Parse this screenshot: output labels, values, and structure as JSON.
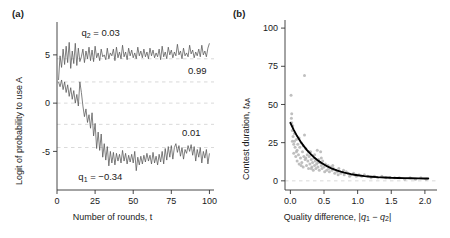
{
  "figure": {
    "width": 450,
    "height": 238,
    "background": "#ffffff"
  },
  "panel_a": {
    "label": "(a)",
    "chart_data": {
      "type": "line",
      "title": "",
      "xlabel": "Number of rounds, t",
      "ylabel": "Logit of probability to use A",
      "xlim": [
        0,
        103
      ],
      "ylim": [
        -9.0,
        8.2
      ],
      "xticks": [
        0,
        25,
        50,
        75,
        100
      ],
      "xticklabels": [
        "0",
        "25",
        "50",
        "75",
        "100"
      ],
      "yticks": [
        -5,
        0,
        5
      ],
      "yticklabels": [
        "-5",
        "0",
        "5"
      ],
      "grid": true,
      "gridlines_y": [
        4.595,
        2.197,
        0,
        -2.197,
        -4.595
      ],
      "grid_color": "#c8c8c8",
      "line_color": "#555555",
      "annotations": [
        {
          "text": "q2 = 0.03",
          "x": 16,
          "y": 7.0,
          "name": "q2-annotation"
        },
        {
          "text": "0.99",
          "x": 86,
          "y": 3.0,
          "name": "upper-prob-annotation"
        },
        {
          "text": "0.01",
          "x": 82,
          "y": -3.4,
          "name": "lower-prob-annotation"
        },
        {
          "text": "q1 = -0.34",
          "x": 14,
          "y": -8.0,
          "name": "q1-annotation"
        }
      ],
      "series": [
        {
          "name": "q2 = 0.03 (upper trace, converges to p = 0.99)",
          "plateau": 4.9,
          "x": [
            1,
            2,
            3,
            4,
            5,
            6,
            7,
            8,
            9,
            10,
            11,
            12,
            13,
            14,
            15,
            16,
            17,
            18,
            19,
            20,
            21,
            22,
            23,
            24,
            25,
            26,
            27,
            28,
            29,
            30,
            31,
            32,
            33,
            34,
            35,
            36,
            37,
            38,
            39,
            40,
            41,
            42,
            43,
            44,
            45,
            46,
            47,
            48,
            49,
            50,
            51,
            52,
            53,
            54,
            55,
            56,
            57,
            58,
            59,
            60,
            61,
            62,
            63,
            64,
            65,
            66,
            67,
            68,
            69,
            70,
            71,
            72,
            73,
            74,
            75,
            76,
            77,
            78,
            79,
            80,
            81,
            82,
            83,
            84,
            85,
            86,
            87,
            88,
            89,
            90,
            91,
            92,
            93,
            94,
            95,
            96,
            97,
            98,
            99,
            100
          ],
          "values": [
            2.4,
            4.9,
            3.7,
            5.6,
            4.0,
            5.9,
            4.2,
            6.3,
            3.6,
            5.4,
            4.1,
            6.2,
            3.9,
            5.7,
            4.3,
            4.8,
            5.6,
            4.2,
            5.4,
            4.6,
            5.8,
            4.4,
            5.5,
            4.3,
            5.9,
            4.7,
            5.2,
            4.4,
            5.6,
            4.8,
            5.0,
            4.5,
            5.7,
            4.6,
            5.2,
            4.9,
            5.6,
            4.4,
            5.8,
            4.7,
            5.3,
            4.6,
            6.0,
            4.8,
            5.3,
            4.5,
            5.7,
            4.9,
            5.5,
            4.7,
            5.2,
            4.6,
            5.8,
            4.9,
            5.4,
            4.7,
            5.6,
            4.8,
            5.3,
            4.6,
            5.7,
            4.9,
            5.5,
            4.7,
            5.2,
            4.8,
            5.6,
            4.5,
            5.9,
            4.8,
            5.3,
            4.6,
            5.8,
            5.0,
            5.5,
            4.7,
            5.3,
            4.9,
            6.1,
            5.0,
            5.4,
            4.6,
            5.7,
            4.9,
            5.2,
            4.8,
            6.0,
            5.1,
            5.5,
            4.7,
            5.3,
            4.9,
            5.6,
            4.8,
            6.0,
            5.0,
            5.4,
            4.8,
            5.7,
            6.2
          ]
        },
        {
          "name": "q1 = -0.34 (lower trace, converges to p = 0.01)",
          "plateau": -5.5,
          "x": [
            1,
            2,
            3,
            4,
            5,
            6,
            7,
            8,
            9,
            10,
            11,
            12,
            13,
            14,
            15,
            16,
            17,
            18,
            19,
            20,
            21,
            22,
            23,
            24,
            25,
            26,
            27,
            28,
            29,
            30,
            31,
            32,
            33,
            34,
            35,
            36,
            37,
            38,
            39,
            40,
            41,
            42,
            43,
            44,
            45,
            46,
            47,
            48,
            49,
            50,
            51,
            52,
            53,
            54,
            55,
            56,
            57,
            58,
            59,
            60,
            61,
            62,
            63,
            64,
            65,
            66,
            67,
            68,
            69,
            70,
            71,
            72,
            73,
            74,
            75,
            76,
            77,
            78,
            79,
            80,
            81,
            82,
            83,
            84,
            85,
            86,
            87,
            88,
            89,
            90,
            91,
            92,
            93,
            94,
            95,
            96,
            97,
            98,
            99,
            100
          ],
          "values": [
            2.2,
            1.7,
            2.4,
            1.4,
            2.2,
            1.1,
            1.9,
            0.7,
            1.6,
            0.4,
            1.3,
            0.0,
            0.9,
            -0.3,
            2.2,
            1.1,
            -0.3,
            -1.4,
            -0.6,
            -2.0,
            -1.2,
            -2.6,
            -1.0,
            -3.4,
            -2.1,
            -4.7,
            -3.0,
            -4.9,
            -3.2,
            -5.6,
            -4.2,
            -5.9,
            -4.5,
            -6.5,
            -5.0,
            -6.2,
            -5.1,
            -6.4,
            -5.2,
            -6.0,
            -5.3,
            -6.2,
            -4.9,
            -6.0,
            -5.2,
            -6.3,
            -5.4,
            -6.1,
            -5.3,
            -6.2,
            -5.0,
            -7.0,
            -5.6,
            -6.4,
            -5.5,
            -6.3,
            -5.4,
            -6.1,
            -5.2,
            -6.0,
            -5.4,
            -6.3,
            -5.1,
            -6.2,
            -5.5,
            -6.4,
            -5.3,
            -6.1,
            -5.0,
            -6.3,
            -4.7,
            -5.9,
            -4.5,
            -5.6,
            -4.4,
            -5.8,
            -4.6,
            -4.2,
            -5.1,
            -4.4,
            -5.5,
            -4.6,
            -5.8,
            -4.8,
            -5.2,
            -4.4,
            -5.0,
            -4.3,
            -5.4,
            -4.5,
            -6.0,
            -4.8,
            -5.6,
            -4.6,
            -6.2,
            -5.0,
            -5.7,
            -4.8,
            -6.3,
            -5.2,
            -5.7
          ]
        }
      ]
    }
  },
  "panel_b": {
    "label": "(b)",
    "chart_data": {
      "type": "scatter",
      "title": "",
      "xlabel": "Quality difference, |q1 - q2|",
      "ylabel": "Contest duration, tAA",
      "xlim": [
        -0.08,
        2.18
      ],
      "ylim": [
        -6,
        104
      ],
      "xticks": [
        0.0,
        0.5,
        1.0,
        1.5,
        2.0
      ],
      "xticklabels": [
        "0.0",
        "0.5",
        "1.0",
        "1.5",
        "2.0"
      ],
      "yticks": [
        0,
        25,
        50,
        75,
        100
      ],
      "yticklabels": [
        "0",
        "25",
        "50",
        "75",
        "100"
      ],
      "grid": true,
      "gridlines_y": [
        0
      ],
      "grid_color": "#c8c8c8",
      "point_color": "#b4b4b4",
      "curve_color": "#000000",
      "curve": {
        "name": "fitted decay curve",
        "formula_note": "exponential-like decay from ~38 at x=0 to ~1.5 at x=2.05",
        "x": [
          0.0,
          0.05,
          0.1,
          0.15,
          0.2,
          0.25,
          0.3,
          0.35,
          0.4,
          0.45,
          0.5,
          0.55,
          0.6,
          0.65,
          0.7,
          0.75,
          0.8,
          0.85,
          0.9,
          0.95,
          1.0,
          1.1,
          1.2,
          1.3,
          1.4,
          1.5,
          1.6,
          1.7,
          1.8,
          1.9,
          2.0,
          2.05
        ],
        "y": [
          38.0,
          33.4,
          29.3,
          25.8,
          22.7,
          20.0,
          17.6,
          15.5,
          13.7,
          12.1,
          10.7,
          9.5,
          8.4,
          7.5,
          6.7,
          6.0,
          5.4,
          4.9,
          4.4,
          4.0,
          3.7,
          3.1,
          2.7,
          2.4,
          2.2,
          2.0,
          1.9,
          1.8,
          1.7,
          1.6,
          1.55,
          1.5
        ]
      },
      "points": [
        [
          0.01,
          56.0
        ],
        [
          0.02,
          44.0
        ],
        [
          0.02,
          38.0
        ],
        [
          0.03,
          33.0
        ],
        [
          0.03,
          26.0
        ],
        [
          0.04,
          29.0
        ],
        [
          0.05,
          24.0
        ],
        [
          0.05,
          18.0
        ],
        [
          0.06,
          31.0
        ],
        [
          0.07,
          22.0
        ],
        [
          0.08,
          16.0
        ],
        [
          0.09,
          27.0
        ],
        [
          0.1,
          20.0
        ],
        [
          0.1,
          13.0
        ],
        [
          0.11,
          24.0
        ],
        [
          0.12,
          17.0
        ],
        [
          0.13,
          11.0
        ],
        [
          0.14,
          22.0
        ],
        [
          0.15,
          15.0
        ],
        [
          0.16,
          25.0
        ],
        [
          0.17,
          12.0
        ],
        [
          0.18,
          19.0
        ],
        [
          0.19,
          9.0
        ],
        [
          0.2,
          16.0
        ],
        [
          0.21,
          69.0
        ],
        [
          0.21,
          30.0
        ],
        [
          0.22,
          14.0
        ],
        [
          0.23,
          21.0
        ],
        [
          0.24,
          10.0
        ],
        [
          0.25,
          17.0
        ],
        [
          0.26,
          13.0
        ],
        [
          0.27,
          8.0
        ],
        [
          0.28,
          16.0
        ],
        [
          0.29,
          11.0
        ],
        [
          0.3,
          19.0
        ],
        [
          0.31,
          14.0
        ],
        [
          0.32,
          9.0
        ],
        [
          0.33,
          12.0
        ],
        [
          0.34,
          7.0
        ],
        [
          0.35,
          15.0
        ],
        [
          0.36,
          10.0
        ],
        [
          0.37,
          13.0
        ],
        [
          0.38,
          8.0
        ],
        [
          0.39,
          11.0
        ],
        [
          0.4,
          20.0
        ],
        [
          0.41,
          9.0
        ],
        [
          0.42,
          14.0
        ],
        [
          0.43,
          7.0
        ],
        [
          0.44,
          12.0
        ],
        [
          0.45,
          19.0
        ],
        [
          0.46,
          10.0
        ],
        [
          0.47,
          8.0
        ],
        [
          0.48,
          13.0
        ],
        [
          0.5,
          9.0
        ],
        [
          0.52,
          11.0
        ],
        [
          0.54,
          7.0
        ],
        [
          0.56,
          10.0
        ],
        [
          0.58,
          6.0
        ],
        [
          0.6,
          9.0
        ],
        [
          0.62,
          7.0
        ],
        [
          0.64,
          8.0
        ],
        [
          0.66,
          5.0
        ],
        [
          0.68,
          7.0
        ],
        [
          0.7,
          6.0
        ],
        [
          0.72,
          8.0
        ],
        [
          0.75,
          5.0
        ],
        [
          0.78,
          6.0
        ],
        [
          0.8,
          4.0
        ],
        [
          0.83,
          6.0
        ],
        [
          0.86,
          5.0
        ],
        [
          0.9,
          4.0
        ],
        [
          0.94,
          5.0
        ],
        [
          0.98,
          3.0
        ],
        [
          1.02,
          4.0
        ],
        [
          1.06,
          3.0
        ],
        [
          1.1,
          4.0
        ],
        [
          1.15,
          3.0
        ],
        [
          1.2,
          2.0
        ],
        [
          1.25,
          3.0
        ],
        [
          1.3,
          2.0
        ],
        [
          1.36,
          3.0
        ],
        [
          1.42,
          2.0
        ],
        [
          1.48,
          2.0
        ],
        [
          1.55,
          2.0
        ],
        [
          1.62,
          2.0
        ],
        [
          1.7,
          1.0
        ],
        [
          1.78,
          2.0
        ],
        [
          1.86,
          1.0
        ],
        [
          1.94,
          2.0
        ],
        [
          2.02,
          1.0
        ],
        [
          0.015,
          41.0
        ],
        [
          0.035,
          36.0
        ],
        [
          0.06,
          26.0
        ],
        [
          0.09,
          19.0
        ],
        [
          0.13,
          28.0
        ],
        [
          0.16,
          10.0
        ],
        [
          0.19,
          23.0
        ],
        [
          0.23,
          15.0
        ],
        [
          0.27,
          19.0
        ],
        [
          0.31,
          8.0
        ],
        [
          0.36,
          17.0
        ],
        [
          0.41,
          12.0
        ],
        [
          0.46,
          15.0
        ],
        [
          0.51,
          6.0
        ],
        [
          0.57,
          8.0
        ],
        [
          0.63,
          10.0
        ],
        [
          0.71,
          4.0
        ],
        [
          0.79,
          7.0
        ],
        [
          0.88,
          3.0
        ],
        [
          0.97,
          4.0
        ]
      ]
    }
  }
}
